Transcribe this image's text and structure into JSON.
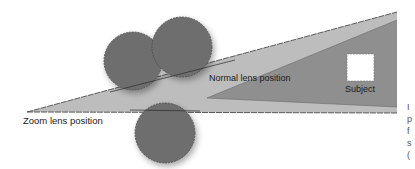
{
  "diagram": {
    "labels": {
      "zoom_lens": "Zoom lens position",
      "normal_lens": "Normal lens position",
      "subject": "Subject"
    },
    "edge_text_fragments": [
      "I",
      "p",
      "f",
      "s",
      "("
    ],
    "colors": {
      "background": "#ffffff",
      "zoom_cone": "#bdbdbd",
      "normal_cone": "#8f8f8f",
      "lens_circle": "#6e6e6e",
      "subject_box": "#ffffff",
      "line": "#3a3a3a"
    }
  }
}
